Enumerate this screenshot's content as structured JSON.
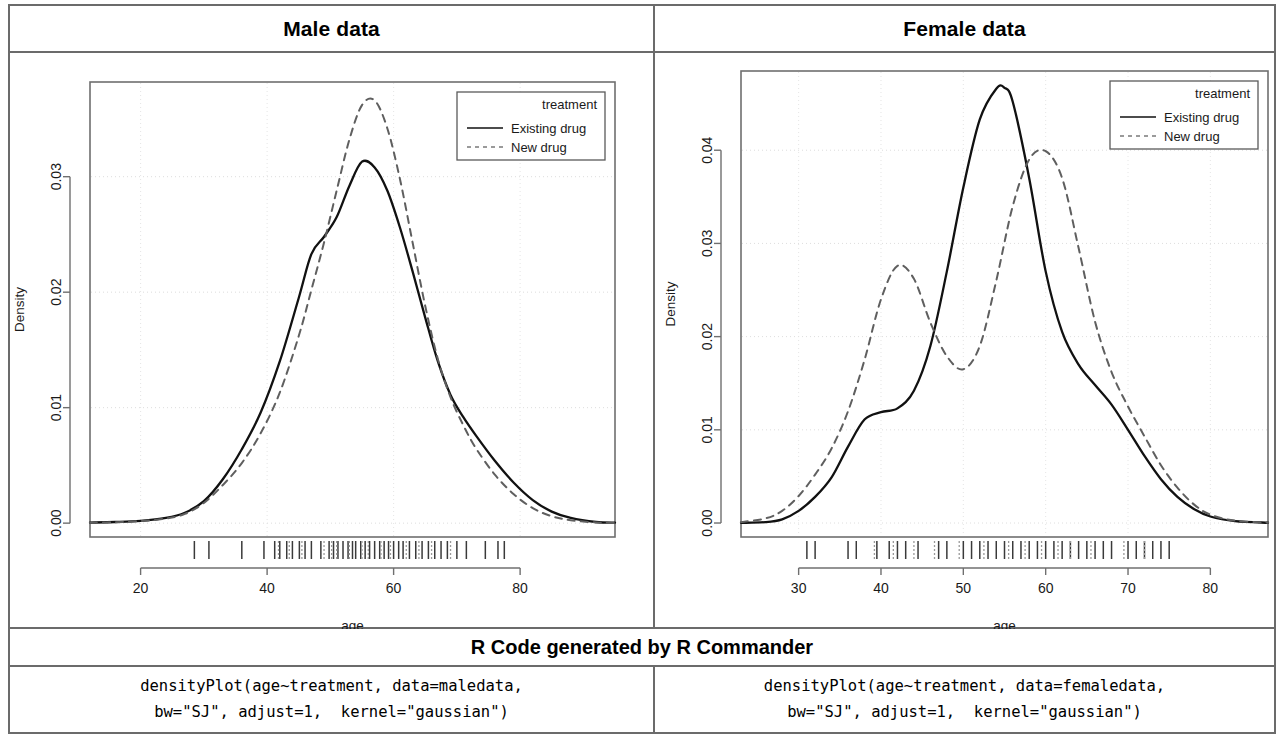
{
  "panels": {
    "left_title": "Male data",
    "right_title": "Female data"
  },
  "code_section": {
    "header": "R Code generated by R Commander",
    "left_line1": "densityPlot(age~treatment, data=maledata,",
    "left_line2": "bw=\"SJ\", adjust=1,  kernel=\"gaussian\")",
    "right_line1": "densityPlot(age~treatment, data=femaledata,",
    "right_line2": "bw=\"SJ\", adjust=1,  kernel=\"gaussian\")"
  },
  "chart_data": [
    {
      "id": "male",
      "type": "line",
      "title": "Male data",
      "xlabel": "age",
      "ylabel": "Density",
      "xlim": [
        12,
        95
      ],
      "ylim": [
        -0.0012,
        0.0382
      ],
      "xticks": [
        "20",
        "40",
        "60",
        "80"
      ],
      "xtick_values": [
        20,
        40,
        60,
        80
      ],
      "yticks": [
        "0.00",
        "0.01",
        "0.02",
        "0.03"
      ],
      "ytick_values": [
        0.0,
        0.01,
        0.02,
        0.03
      ],
      "grid": true,
      "legend": {
        "title": "treatment",
        "position": "top-right",
        "entries": [
          {
            "label": "Existing drug",
            "style": "solid"
          },
          {
            "label": "New drug",
            "style": "dashed"
          }
        ]
      },
      "series": [
        {
          "name": "Existing drug",
          "style": "solid",
          "x": [
            12,
            16,
            20,
            24,
            27,
            30,
            33,
            36,
            39,
            42,
            45,
            47,
            49,
            51,
            53,
            55,
            57,
            59,
            61,
            63,
            65,
            67,
            69,
            71,
            73,
            76,
            79,
            82,
            85,
            88,
            92,
            95
          ],
          "y": [
            5e-05,
            0.0001,
            0.0002,
            0.00045,
            0.0009,
            0.0019,
            0.0038,
            0.0064,
            0.0096,
            0.014,
            0.0195,
            0.0233,
            0.0248,
            0.0265,
            0.0292,
            0.0313,
            0.0308,
            0.0288,
            0.0256,
            0.0218,
            0.0178,
            0.014,
            0.0111,
            0.0092,
            0.0076,
            0.0054,
            0.0035,
            0.002,
            0.001,
            0.00045,
            0.0001,
            4e-05
          ]
        },
        {
          "name": "New drug",
          "style": "dashed",
          "x": [
            12,
            16,
            20,
            24,
            27,
            30,
            33,
            36,
            39,
            42,
            45,
            47,
            49,
            51,
            53,
            55,
            57,
            59,
            61,
            63,
            65,
            67,
            69,
            71,
            73,
            76,
            79,
            82,
            85,
            88,
            92,
            95
          ],
          "y": [
            4e-05,
            8e-05,
            0.00018,
            0.0004,
            0.0008,
            0.00175,
            0.0033,
            0.0052,
            0.0078,
            0.0113,
            0.0162,
            0.0202,
            0.0243,
            0.0288,
            0.0332,
            0.0362,
            0.0366,
            0.0342,
            0.0298,
            0.0243,
            0.0188,
            0.0142,
            0.0109,
            0.0085,
            0.0065,
            0.0042,
            0.0025,
            0.0013,
            0.0006,
            0.00025,
            6e-05,
            2e-05
          ]
        }
      ],
      "rug_existing": [
        28.5,
        30.8,
        36.0,
        39.5,
        41.2,
        42.0,
        43.1,
        44.0,
        45.1,
        46.0,
        47.0,
        48.5,
        49.8,
        50.5,
        51.2,
        52.0,
        52.8,
        53.5,
        54.0,
        54.8,
        55.5,
        56.2,
        57.0,
        57.8,
        58.5,
        59.2,
        60.0,
        60.8,
        61.5,
        62.5,
        63.5,
        64.5,
        65.5,
        66.5,
        67.5,
        68.5,
        70.0,
        71.5,
        74.5,
        76.5,
        77.5
      ],
      "rug_new": [
        41.8,
        43.5,
        45.5,
        49.0,
        50.2,
        51.0,
        53.0,
        55.0,
        56.0,
        58.0,
        59.5,
        62.0,
        64.0,
        66.0,
        69.0
      ]
    },
    {
      "id": "female",
      "type": "line",
      "title": "Female data",
      "xlabel": "age",
      "ylabel": "Density",
      "xlim": [
        23,
        87
      ],
      "ylim": [
        -0.0015,
        0.0485
      ],
      "xticks": [
        "30",
        "40",
        "50",
        "60",
        "70",
        "80"
      ],
      "xtick_values": [
        30,
        40,
        50,
        60,
        70,
        80
      ],
      "yticks": [
        "0.00",
        "0.01",
        "0.02",
        "0.03",
        "0.04"
      ],
      "ytick_values": [
        0.0,
        0.01,
        0.02,
        0.03,
        0.04
      ],
      "grid": true,
      "legend": {
        "title": "treatment",
        "position": "top-right",
        "entries": [
          {
            "label": "Existing drug",
            "style": "solid"
          },
          {
            "label": "New drug",
            "style": "dashed"
          }
        ]
      },
      "series": [
        {
          "name": "Existing drug",
          "style": "solid",
          "x": [
            23,
            26,
            28,
            30,
            32,
            34,
            36,
            38,
            40,
            42,
            44,
            46,
            48,
            50,
            52,
            54,
            55,
            56,
            58,
            60,
            62,
            64,
            66,
            68,
            70,
            72,
            74,
            76,
            78,
            80,
            83,
            87
          ],
          "y": [
            2e-05,
            0.0001,
            0.0004,
            0.0013,
            0.0028,
            0.0049,
            0.0082,
            0.0111,
            0.0119,
            0.0123,
            0.0142,
            0.019,
            0.027,
            0.036,
            0.0433,
            0.0466,
            0.0467,
            0.0452,
            0.037,
            0.027,
            0.0205,
            0.017,
            0.0148,
            0.0127,
            0.01,
            0.0072,
            0.0047,
            0.0028,
            0.0015,
            0.0007,
            0.0002,
            3e-05
          ]
        },
        {
          "name": "New drug",
          "style": "dashed",
          "x": [
            23,
            26,
            28,
            30,
            32,
            34,
            36,
            38,
            40,
            42,
            44,
            46,
            48,
            50,
            52,
            54,
            56,
            58,
            60,
            62,
            64,
            66,
            68,
            70,
            72,
            74,
            76,
            78,
            80,
            83,
            87
          ],
          "y": [
            0.0001,
            0.0005,
            0.0013,
            0.0029,
            0.0052,
            0.008,
            0.012,
            0.0175,
            0.024,
            0.0276,
            0.0262,
            0.0215,
            0.0179,
            0.0165,
            0.019,
            0.026,
            0.034,
            0.039,
            0.0399,
            0.037,
            0.0295,
            0.0216,
            0.0162,
            0.0125,
            0.0093,
            0.0062,
            0.0038,
            0.002,
            0.0009,
            0.00025,
            4e-05
          ]
        }
      ],
      "rug_existing": [
        31.0,
        32.0,
        36.0,
        37.0,
        39.5,
        41.0,
        42.0,
        43.0,
        44.5,
        47.0,
        48.0,
        50.0,
        51.0,
        52.0,
        53.0,
        54.0,
        55.0,
        56.0,
        57.0,
        58.0,
        59.0,
        60.0,
        61.0,
        62.0,
        63.0,
        64.0,
        65.0,
        66.0,
        67.0,
        68.0,
        70.0,
        71.0,
        72.0,
        73.0,
        74.0,
        75.0
      ],
      "rug_new": [
        39.2,
        41.5,
        44.0,
        46.5,
        49.5,
        52.5,
        55.5,
        57.5,
        59.5,
        61.5,
        63.0,
        65.5,
        69.5,
        72.0
      ]
    }
  ]
}
